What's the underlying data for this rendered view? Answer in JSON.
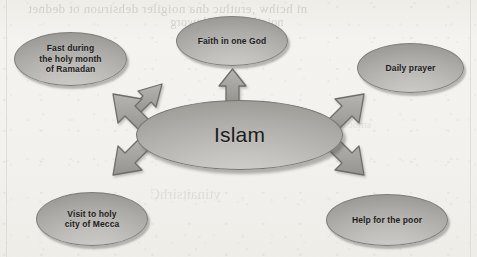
{
  "page": {
    "background_color": "#f3f2ee",
    "showthrough_text": [
      "ni hcihw ,erutluc dna noigiler dehsiruon ot dednet",
      "noigiler eht fo htworg",
      "smoc eht fo trap",
      "ytinaitsirhC"
    ]
  },
  "diagram": {
    "type": "concept-map",
    "title": "Islam",
    "center": {
      "label": "Islam",
      "fill": "#b0aeaa",
      "stroke": "#76746f"
    },
    "nodes": [
      {
        "id": "fast",
        "label": "Fast during\nthe holy month\nof Ramadan",
        "direction": "up-left",
        "fill": "#adaba7"
      },
      {
        "id": "faith",
        "label": "Faith in one God",
        "direction": "up",
        "fill": "#adaba7"
      },
      {
        "id": "prayer",
        "label": "Daily prayer",
        "direction": "up-right",
        "fill": "#adaba7"
      },
      {
        "id": "mecca",
        "label": "Visit to holy\ncity of Mecca",
        "direction": "down-left",
        "fill": "#adaba7"
      },
      {
        "id": "poor",
        "label": "Help for the poor",
        "direction": "down-right",
        "fill": "#adaba7"
      }
    ],
    "arrows": {
      "count": 5,
      "fill": "#a8a6a2",
      "stroke": "#6f6d69",
      "style": "block-arrow"
    }
  }
}
